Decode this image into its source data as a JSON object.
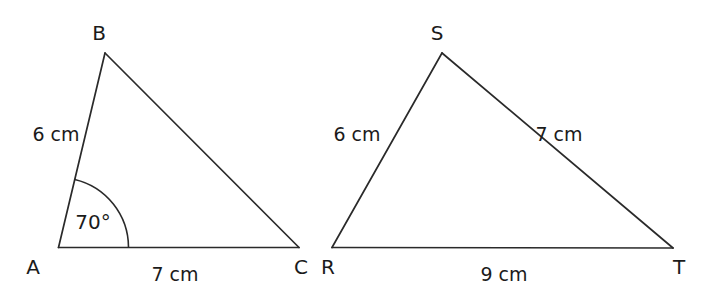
{
  "figure": {
    "background_color": "#ffffff",
    "stroke_color": "#2a2a2a",
    "text_color": "#1b1b1b"
  },
  "triangle_left": {
    "name": "triangle-abc",
    "vertices": {
      "a": "A",
      "b": "B",
      "c": "C"
    },
    "sides": {
      "ab": "6 cm",
      "bc": "",
      "ac": "7 cm"
    },
    "angle": {
      "at": "A",
      "value": "70°"
    }
  },
  "triangle_right": {
    "name": "triangle-rst",
    "vertices": {
      "r": "R",
      "s": "S",
      "t": "T"
    },
    "sides": {
      "rs": "6 cm",
      "st": "7 cm",
      "rt": "9 cm"
    }
  }
}
